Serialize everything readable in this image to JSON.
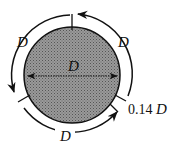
{
  "diagram": {
    "fill_color": "#8a8a8a",
    "stroke_color": "#111111",
    "labels": {
      "diameter": "D",
      "arc_top_left": "D",
      "arc_top_right": "D",
      "arc_bottom": "D",
      "gap_value": "0.14",
      "gap_unit": "D"
    }
  }
}
